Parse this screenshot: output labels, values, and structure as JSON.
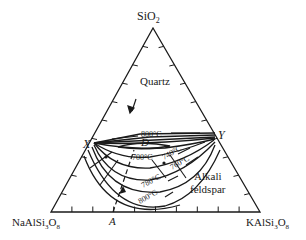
{
  "diagram": {
    "type": "ternary-phase-diagram",
    "vertices": {
      "top": {
        "base": "SiO",
        "sub": "2"
      },
      "left": {
        "parts": [
          "NaAlSi",
          "3",
          "O",
          "8"
        ]
      },
      "right": {
        "parts": [
          "KAlSi",
          "3",
          "O",
          "8"
        ]
      }
    },
    "fields": {
      "quartz": "Quartz",
      "feldspar_line1": "Alkali",
      "feldspar_line2": "feldspar"
    },
    "points": {
      "x": "X",
      "y": "Y",
      "d": "D",
      "a": "A"
    },
    "isotherms": {
      "t800_top": "800°C",
      "t700": "700°C",
      "t740": "740°C",
      "t760": "760°C",
      "t780": "780°C",
      "t800_bottom": "800°C"
    }
  }
}
